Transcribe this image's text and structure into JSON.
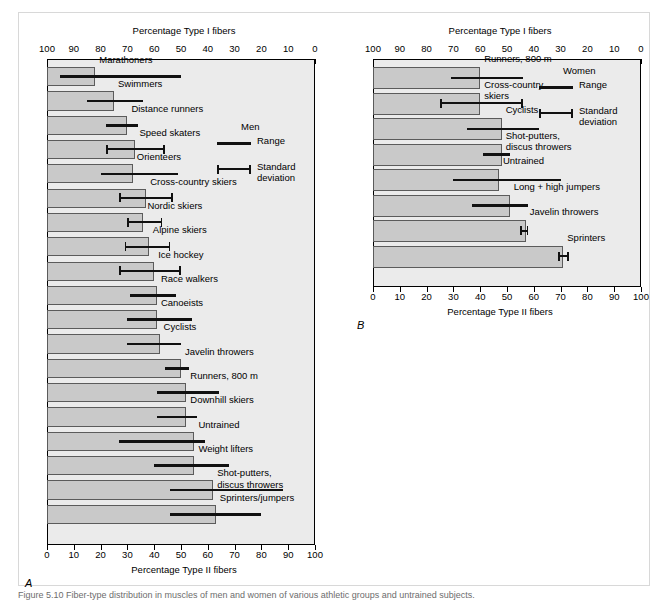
{
  "figure": {
    "caption": "Figure 5.10 Fiber-type distribution in muscles of men and women of various athletic groups and untrained subjects.",
    "panels": [
      {
        "id": "A",
        "group": "Men",
        "top_axis_title": "Percentage Type I fibers",
        "bottom_axis_title": "Percentage Type II fibers",
        "top_ticks": [
          "100",
          "90",
          "80",
          "70",
          "60",
          "50",
          "40",
          "30",
          "20",
          "10",
          "0"
        ],
        "bottom_ticks": [
          "0",
          "10",
          "20",
          "30",
          "40",
          "50",
          "60",
          "70",
          "80",
          "90",
          "100"
        ],
        "legend": {
          "title": "Men",
          "range_label": "Range",
          "sd_label": "Standard\ndeviation"
        },
        "bars": [
          {
            "label": "Marathoners",
            "type2": 18,
            "marker": "range",
            "low": 5,
            "high": 50
          },
          {
            "label": "Swimmers",
            "type2": 25,
            "marker": "range",
            "low": 15,
            "high": 36
          },
          {
            "label": "Distance runners",
            "type2": 30,
            "marker": "range",
            "low": 22,
            "high": 34
          },
          {
            "label": "Speed skaters",
            "type2": 33,
            "marker": "sd",
            "low": 22,
            "high": 44
          },
          {
            "label": "Orienteers",
            "type2": 32,
            "marker": "range",
            "low": 20,
            "high": 49
          },
          {
            "label": "Cross-country skiers",
            "type2": 37,
            "marker": "sd",
            "low": 27,
            "high": 47
          },
          {
            "label": "Nordic skiers",
            "type2": 36,
            "marker": "sd",
            "low": 30,
            "high": 43
          },
          {
            "label": "Alpine skiers",
            "type2": 38,
            "marker": "sd",
            "low": 29,
            "high": 46
          },
          {
            "label": "Ice hockey",
            "type2": 40,
            "marker": "sd",
            "low": 27,
            "high": 50
          },
          {
            "label": "Race walkers",
            "type2": 41,
            "marker": "range",
            "low": 31,
            "high": 48
          },
          {
            "label": "Canoeists",
            "type2": 41,
            "marker": "range",
            "low": 30,
            "high": 54
          },
          {
            "label": "Cyclists",
            "type2": 42,
            "marker": "range",
            "low": 30,
            "high": 50
          },
          {
            "label": "Javelin throwers",
            "type2": 50,
            "marker": "range",
            "low": 44,
            "high": 53
          },
          {
            "label": "Runners, 800 m",
            "type2": 52,
            "marker": "range",
            "low": 41,
            "high": 64
          },
          {
            "label": "Downhill skiers",
            "type2": 52,
            "marker": "range",
            "low": 41,
            "high": 56
          },
          {
            "label": "Untrained",
            "type2": 55,
            "marker": "range",
            "low": 27,
            "high": 59
          },
          {
            "label": "Weight lifters",
            "type2": 55,
            "marker": "range",
            "low": 40,
            "high": 68
          },
          {
            "label": "Shot-putters,\ndiscus throwers",
            "type2": 62,
            "marker": "range",
            "low": 46,
            "high": 88
          },
          {
            "label": "Sprinters/jumpers",
            "type2": 63,
            "marker": "range",
            "low": 46,
            "high": 80
          }
        ]
      },
      {
        "id": "B",
        "group": "Women",
        "top_axis_title": "Percentage Type I fibers",
        "bottom_axis_title": "Percentage Type II fibers",
        "top_ticks": [
          "100",
          "90",
          "80",
          "70",
          "60",
          "50",
          "40",
          "30",
          "20",
          "10",
          "0"
        ],
        "bottom_ticks": [
          "0",
          "10",
          "20",
          "30",
          "40",
          "50",
          "60",
          "70",
          "80",
          "90",
          "100"
        ],
        "legend": {
          "title": "Women",
          "range_label": "Range",
          "sd_label": "Standard\ndeviation"
        },
        "bars": [
          {
            "label": "Runners, 800 m",
            "type2": 40,
            "marker": "range",
            "low": 29,
            "high": 56
          },
          {
            "label": "Cross-country\nskiers",
            "type2": 40,
            "marker": "sd",
            "low": 25,
            "high": 56
          },
          {
            "label": "Cyclists",
            "type2": 48,
            "marker": "range",
            "low": 35,
            "high": 62
          },
          {
            "label": "Shot-putters,\ndiscus throwers",
            "type2": 48,
            "marker": "range",
            "low": 41,
            "high": 51
          },
          {
            "label": "Untrained",
            "type2": 47,
            "marker": "range",
            "low": 30,
            "high": 70
          },
          {
            "label": "Long + high jumpers",
            "type2": 51,
            "marker": "range",
            "low": 37,
            "high": 58
          },
          {
            "label": "Javelin throwers",
            "type2": 57,
            "marker": "sd",
            "low": 55,
            "high": 58
          },
          {
            "label": "Sprinters",
            "type2": 71,
            "marker": "sd",
            "low": 69,
            "high": 73
          }
        ]
      }
    ]
  }
}
